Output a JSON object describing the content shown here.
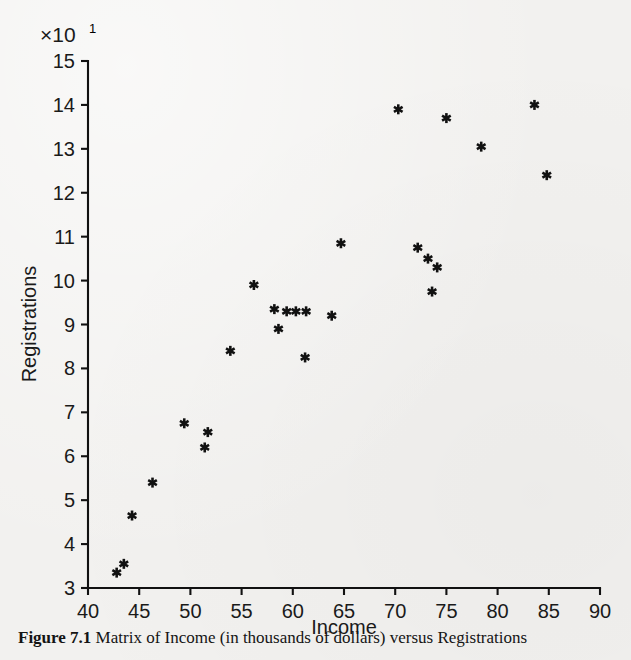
{
  "figure": {
    "exponent_prefix": "×10",
    "exponent_power": "1",
    "caption_label": "Figure 7.1",
    "caption_text": "Matrix of Income (in thousands of dollars) versus Registrations"
  },
  "chart_data": {
    "type": "scatter",
    "title": "",
    "xlabel": "Income",
    "ylabel": "Registrations",
    "y_axis_multiplier": "×10¹",
    "xlim": [
      40,
      90
    ],
    "ylim": [
      3,
      15
    ],
    "xticks": [
      40,
      45,
      50,
      55,
      60,
      65,
      70,
      75,
      80,
      85,
      90
    ],
    "yticks": [
      3,
      4,
      5,
      6,
      7,
      8,
      9,
      10,
      11,
      12,
      13,
      14,
      15
    ],
    "xtick_labels": [
      "40",
      "45",
      "50",
      "55",
      "60",
      "65",
      "70",
      "75",
      "80",
      "85",
      "90"
    ],
    "ytick_labels": [
      "3",
      "4",
      "5",
      "6",
      "7",
      "8",
      "9",
      "10",
      "11",
      "12",
      "13",
      "14",
      "15"
    ],
    "grid": false,
    "legend": null,
    "marker_style": "asterisk-star",
    "marker_color": "#111111",
    "points": [
      {
        "x": 42.8,
        "y": 3.35
      },
      {
        "x": 43.5,
        "y": 3.55
      },
      {
        "x": 44.3,
        "y": 4.65
      },
      {
        "x": 46.3,
        "y": 5.4
      },
      {
        "x": 49.4,
        "y": 6.75
      },
      {
        "x": 51.7,
        "y": 6.55
      },
      {
        "x": 51.4,
        "y": 6.2
      },
      {
        "x": 53.9,
        "y": 8.4
      },
      {
        "x": 56.2,
        "y": 9.9
      },
      {
        "x": 58.2,
        "y": 9.35
      },
      {
        "x": 58.6,
        "y": 8.9
      },
      {
        "x": 59.4,
        "y": 9.3
      },
      {
        "x": 60.3,
        "y": 9.3
      },
      {
        "x": 61.3,
        "y": 9.3
      },
      {
        "x": 61.2,
        "y": 8.25
      },
      {
        "x": 63.8,
        "y": 9.2
      },
      {
        "x": 64.7,
        "y": 10.85
      },
      {
        "x": 70.3,
        "y": 13.9
      },
      {
        "x": 72.2,
        "y": 10.75
      },
      {
        "x": 73.2,
        "y": 10.5
      },
      {
        "x": 74.1,
        "y": 10.3
      },
      {
        "x": 73.6,
        "y": 9.75
      },
      {
        "x": 75.0,
        "y": 13.7
      },
      {
        "x": 78.4,
        "y": 13.05
      },
      {
        "x": 83.6,
        "y": 14.0
      },
      {
        "x": 84.8,
        "y": 12.4
      }
    ]
  }
}
